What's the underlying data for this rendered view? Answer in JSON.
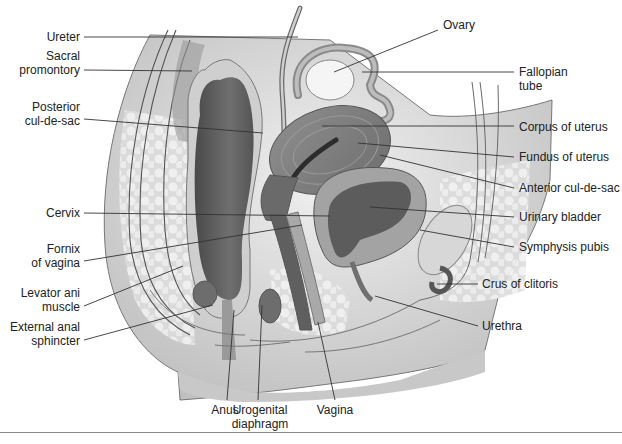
{
  "figure": {
    "type": "anatomical-diagram",
    "labels_left": [
      {
        "id": "ureter",
        "text": "Ureter"
      },
      {
        "id": "sacral-promontory",
        "line1": "Sacral",
        "line2": "promontory"
      },
      {
        "id": "posterior-cul-de-sac",
        "line1": "Posterior",
        "line2": "cul-de-sac"
      },
      {
        "id": "cervix",
        "text": "Cervix"
      },
      {
        "id": "fornix-of-vagina",
        "line1": "Fornix",
        "line2": "of vagina"
      },
      {
        "id": "levator-ani-muscle",
        "line1": "Levator ani",
        "line2": "muscle"
      },
      {
        "id": "external-anal-sphincter",
        "line1": "External anal",
        "line2": "sphincter"
      }
    ],
    "labels_right": [
      {
        "id": "ovary",
        "text": "Ovary"
      },
      {
        "id": "fallopian-tube",
        "line1": "Fallopian",
        "line2": "tube"
      },
      {
        "id": "corpus-of-uterus",
        "text": "Corpus of uterus"
      },
      {
        "id": "fundus-of-uterus",
        "text": "Fundus of uterus"
      },
      {
        "id": "anterior-cul-de-sac",
        "text": "Anterior cul-de-sac"
      },
      {
        "id": "urinary-bladder",
        "text": "Urinary bladder"
      },
      {
        "id": "symphysis-pubis",
        "text": "Symphysis pubis"
      },
      {
        "id": "crus-of-clitoris",
        "text": "Crus of clitoris"
      },
      {
        "id": "urethra",
        "text": "Urethra"
      }
    ],
    "labels_bottom": [
      {
        "id": "anus",
        "text": "Anus"
      },
      {
        "id": "urogenital-diaphragm",
        "line1": "Urogenital",
        "line2": "diaphragm"
      },
      {
        "id": "vagina",
        "text": "Vagina"
      }
    ],
    "colors": {
      "background": "#ffffff",
      "leader_line": "#333333",
      "tissue_light": "#e2e2e2",
      "tissue_mid": "#a8a8a8",
      "tissue_dark": "#5e5e5e",
      "rectum": "#666666",
      "rule": "#888888"
    }
  }
}
